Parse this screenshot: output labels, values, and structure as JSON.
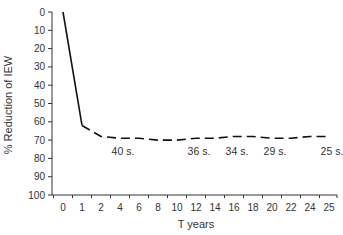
{
  "chart_data": {
    "type": "line",
    "title": "",
    "xlabel": "T years",
    "ylabel": "% Reduction of IEW",
    "x": [
      0,
      1,
      2,
      4,
      6,
      8,
      10,
      12,
      14,
      16,
      18,
      20,
      22,
      24,
      25
    ],
    "series": [
      {
        "name": "IEW reduction",
        "values": [
          0,
          62,
          68,
          69,
          69,
          70,
          70,
          69,
          69,
          68,
          68,
          69,
          69,
          68,
          68
        ],
        "style_solid_until_index": 1
      }
    ],
    "ylim": [
      0,
      100
    ],
    "y_inverted": true,
    "yticks": [
      0,
      10,
      20,
      30,
      40,
      50,
      60,
      70,
      80,
      90,
      100
    ],
    "xtick_labels": [
      "0",
      "1",
      "2",
      "4",
      "6",
      "8",
      "10",
      "12",
      "14",
      "16",
      "18",
      "20",
      "22",
      "24",
      "25"
    ],
    "annotations": [
      {
        "text": "40 s.",
        "x_index": 3
      },
      {
        "text": "36 s.",
        "x_index": 7
      },
      {
        "text": "34 s.",
        "x_index": 9
      },
      {
        "text": "29 s.",
        "x_index": 11
      },
      {
        "text": "25 s.",
        "x_index": 14
      }
    ],
    "grid": false,
    "legend": "none"
  }
}
